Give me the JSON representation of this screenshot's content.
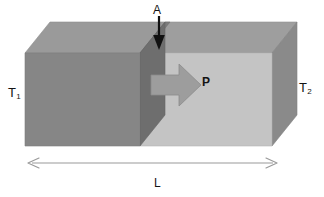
{
  "figure": {
    "type": "physics-diagram",
    "labels": {
      "left_temperature": "T",
      "left_temperature_sub": "1",
      "right_temperature": "T",
      "right_temperature_sub": "2",
      "cross_section_area": "A",
      "power_flow": "P",
      "length": "L"
    },
    "icons": {
      "area_pointer": "down-arrow-icon",
      "heat_flow": "right-arrow-icon",
      "length_dimension": "double-headed-arrow-icon"
    },
    "colors": {
      "front_face_left": "#868686",
      "front_face_right": "#c4c4c4",
      "top_face_left": "#9a9a9a",
      "top_face_right": "#9e9e9e",
      "cross_section_plane": "#6e6e6e",
      "cross_section_top": "#7c7c7c",
      "right_side_face": "#8a8a8a",
      "heat_arrow": "#9d9d9d",
      "heat_arrow_edge": "#8a8a8a",
      "area_arrow": "#111111",
      "dimension_arrow": "#9a9a9a",
      "label_text": "#141414",
      "background": "#ffffff"
    },
    "geometry": {
      "front_left_x": 25,
      "front_right_x": 272,
      "front_top_y": 53,
      "front_bottom_y": 146,
      "depth_dx": 25,
      "depth_dy": 31,
      "section_front_x": 140,
      "dimension_line_y": 163
    }
  }
}
